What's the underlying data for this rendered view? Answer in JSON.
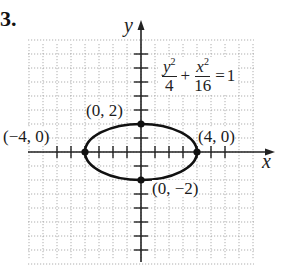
{
  "problem": {
    "number": "3."
  },
  "axes": {
    "x_label": "x",
    "y_label": "y"
  },
  "equation": {
    "term1": {
      "numerator_var": "y",
      "numerator_exp": "2",
      "denominator": "4"
    },
    "plus": "+",
    "term2": {
      "numerator_var": "x",
      "numerator_exp": "2",
      "denominator": "16"
    },
    "equals": "=",
    "rhs": "1"
  },
  "points": [
    {
      "label": "(0, 2)",
      "x": 0,
      "y": 2
    },
    {
      "label": "(−4, 0)",
      "x": -4,
      "y": 0
    },
    {
      "label": "(4, 0)",
      "x": 4,
      "y": 0
    },
    {
      "label": "(0, −2)",
      "x": 0,
      "y": -2
    }
  ],
  "colors": {
    "curve": "#111111",
    "grid": "#9a9a9a",
    "axis": "#222222"
  },
  "chart_data": {
    "type": "line",
    "xlabel": "x",
    "ylabel": "y",
    "xlim": [
      -8,
      8
    ],
    "ylim": [
      -8,
      8
    ],
    "grid": true,
    "grid_spacing": 2,
    "tick_spacing": 1,
    "series": [
      {
        "name": "ellipse y^2/4 + x^2/16 = 1",
        "center": [
          0,
          0
        ],
        "semi_major_x": 4,
        "semi_minor_y": 2,
        "x": [
          4,
          3.46,
          2,
          0,
          -2,
          -3.46,
          -4,
          -3.46,
          -2,
          0,
          2,
          3.46,
          4
        ],
        "y": [
          0,
          1,
          1.73,
          2,
          1.73,
          1,
          0,
          -1,
          -1.73,
          -2,
          -1.73,
          -1,
          0
        ]
      }
    ],
    "annotations": [
      {
        "text": "(0, 2)",
        "x": 0,
        "y": 2
      },
      {
        "text": "(−4, 0)",
        "x": -4,
        "y": 0
      },
      {
        "text": "(4, 0)",
        "x": 4,
        "y": 0
      },
      {
        "text": "(0, −2)",
        "x": 0,
        "y": -2
      },
      {
        "text": "y²/4 + x²/16 = 1",
        "x": 1.5,
        "y": 5
      }
    ]
  }
}
